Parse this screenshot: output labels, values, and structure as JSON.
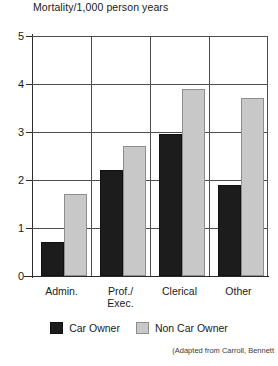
{
  "chart_data": {
    "type": "bar",
    "title": "Mortality/1,000 person years",
    "xlabel": "",
    "ylabel": "Mortality/1,000 person years",
    "ylim": [
      0,
      5
    ],
    "yticks": [
      "0",
      "1",
      "2",
      "3",
      "4",
      "5"
    ],
    "grid": true,
    "legend_position": "bottom",
    "categories": [
      "Admin.",
      "Prof./\nExec.",
      "Clerical",
      "Other"
    ],
    "category_labels": [
      {
        "line1": "Admin.",
        "line2": ""
      },
      {
        "line1": "Prof./",
        "line2": "Exec."
      },
      {
        "line1": "Clerical",
        "line2": ""
      },
      {
        "line1": "Other",
        "line2": ""
      }
    ],
    "series": [
      {
        "name": "Car Owner",
        "color": "#1c1c1c",
        "values": [
          0.7,
          2.2,
          2.95,
          1.9
        ]
      },
      {
        "name": "Non Car Owner",
        "color": "#c8c8c8",
        "values": [
          1.7,
          2.7,
          3.9,
          3.7
        ]
      }
    ],
    "annotations": {
      "source_line1": "(Adapted from Carroll, Bennett",
      "source_line2": ""
    }
  },
  "legend": {
    "items": [
      {
        "label": "Car Owner"
      },
      {
        "label": "Non Car Owner"
      }
    ]
  }
}
